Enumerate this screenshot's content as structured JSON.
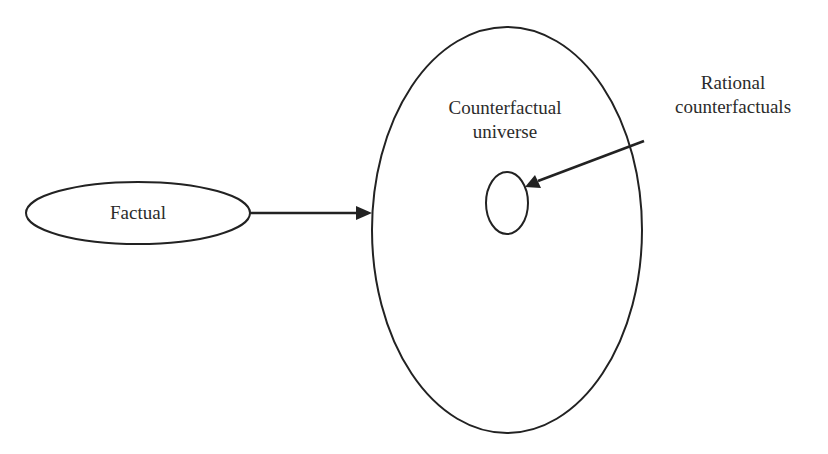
{
  "diagram": {
    "type": "concept-diagram",
    "nodes": {
      "factual": {
        "label": "Factual"
      },
      "universe": {
        "label_line1": "Counterfactual",
        "label_line2": "universe"
      },
      "rational": {
        "label_line1": "Rational",
        "label_line2": "counterfactuals"
      }
    },
    "edges": [
      {
        "from": "Factual",
        "to": "Counterfactual universe"
      },
      {
        "from": "Rational counterfactuals",
        "to": "rational subset (small ellipse)"
      }
    ],
    "colors": {
      "stroke": "#222222",
      "text": "#2b2b2b",
      "background": "#ffffff"
    }
  }
}
